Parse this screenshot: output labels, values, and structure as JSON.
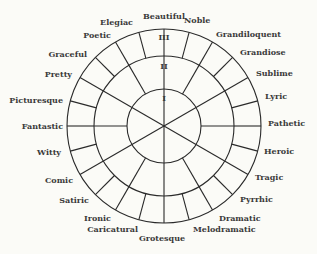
{
  "diagram": {
    "center": [
      164,
      126
    ],
    "radii": {
      "inner": 37,
      "middle": 70,
      "outer": 97
    },
    "stroke_color": "#2a2a2a",
    "text_color": "#3a3a3a",
    "background": "#fbfbf7",
    "ring_labels": [
      {
        "label": "I",
        "x": 164,
        "y": 101
      },
      {
        "label": "II",
        "x": 164,
        "y": 69
      },
      {
        "label": "III",
        "x": 164,
        "y": 40
      }
    ],
    "inner_spokes_deg": [
      30,
      90,
      150,
      210,
      270,
      330
    ],
    "middle_spokes_deg": [
      0,
      30,
      60,
      90,
      120,
      150,
      180,
      210,
      240,
      270,
      300,
      330
    ],
    "outer_spokes_deg": [
      0,
      15,
      30,
      45,
      60,
      75,
      90,
      105,
      120,
      135,
      150,
      165,
      180,
      195,
      210,
      225,
      240,
      255,
      270,
      285,
      300,
      315,
      330,
      345
    ],
    "terms": [
      {
        "label": "Beautiful",
        "x": 164,
        "y": 19,
        "anchor": "middle"
      },
      {
        "label": "Noble",
        "x": 184,
        "y": 23,
        "anchor": "start"
      },
      {
        "label": "Grandiloquent",
        "x": 216,
        "y": 37,
        "anchor": "start"
      },
      {
        "label": "Grandiose",
        "x": 240,
        "y": 55,
        "anchor": "start"
      },
      {
        "label": "Sublime",
        "x": 256,
        "y": 76,
        "anchor": "start"
      },
      {
        "label": "Lyric",
        "x": 265,
        "y": 99,
        "anchor": "start"
      },
      {
        "label": "Pathetic",
        "x": 268,
        "y": 126,
        "anchor": "start"
      },
      {
        "label": "Heroic",
        "x": 264,
        "y": 154,
        "anchor": "start"
      },
      {
        "label": "Tragic",
        "x": 255,
        "y": 180,
        "anchor": "start"
      },
      {
        "label": "Pyrrhic",
        "x": 240,
        "y": 202,
        "anchor": "start"
      },
      {
        "label": "Dramatic",
        "x": 219,
        "y": 221,
        "anchor": "start"
      },
      {
        "label": "Melodramatic",
        "x": 193,
        "y": 232,
        "anchor": "start"
      },
      {
        "label": "Grotesque",
        "x": 162,
        "y": 241,
        "anchor": "middle"
      },
      {
        "label": "Caricatural",
        "x": 138,
        "y": 232,
        "anchor": "end"
      },
      {
        "label": "Ironic",
        "x": 111,
        "y": 221,
        "anchor": "end"
      },
      {
        "label": "Satiric",
        "x": 89,
        "y": 203,
        "anchor": "end"
      },
      {
        "label": "Comic",
        "x": 73,
        "y": 183,
        "anchor": "end"
      },
      {
        "label": "Witty",
        "x": 61,
        "y": 155,
        "anchor": "end"
      },
      {
        "label": "Fantastic",
        "x": 63,
        "y": 129,
        "anchor": "end"
      },
      {
        "label": "Picturesque",
        "x": 63,
        "y": 103,
        "anchor": "end"
      },
      {
        "label": "Pretty",
        "x": 72,
        "y": 77,
        "anchor": "end"
      },
      {
        "label": "Graceful",
        "x": 87,
        "y": 57,
        "anchor": "end"
      },
      {
        "label": "Poetic",
        "x": 111,
        "y": 38,
        "anchor": "end"
      },
      {
        "label": "Elegiac",
        "x": 133,
        "y": 25,
        "anchor": "end"
      }
    ]
  }
}
